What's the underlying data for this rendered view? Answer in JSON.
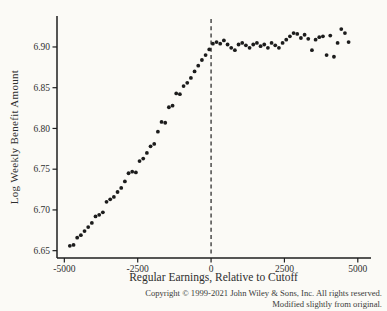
{
  "chart_data": {
    "type": "scatter",
    "title": "",
    "xlabel": "Regular Earnings, Relative to Cutoff",
    "ylabel": "Log Weekly Benefit Amount",
    "xlim": [
      -5250,
      5450
    ],
    "ylim": [
      6.641,
      6.938
    ],
    "x_ticks": [
      -5000,
      -2500,
      0,
      2500,
      5000
    ],
    "y_ticks": [
      6.65,
      6.7,
      6.75,
      6.8,
      6.85,
      6.9
    ],
    "grid": false,
    "legend": "none",
    "cutoff_line": {
      "x": 0,
      "style": "dashed",
      "color": "#1e1e1e"
    },
    "marker_color": "#1c1c1c",
    "axis_color": "#1e1e1e",
    "series": [
      {
        "name": "binned-means",
        "points": [
          [
            -4812,
            6.656
          ],
          [
            -4687,
            6.657
          ],
          [
            -4562,
            6.666
          ],
          [
            -4437,
            6.669
          ],
          [
            -4312,
            6.674
          ],
          [
            -4187,
            6.679
          ],
          [
            -4062,
            6.684
          ],
          [
            -3937,
            6.692
          ],
          [
            -3812,
            6.694
          ],
          [
            -3687,
            6.697
          ],
          [
            -3562,
            6.71
          ],
          [
            -3437,
            6.713
          ],
          [
            -3312,
            6.716
          ],
          [
            -3187,
            6.722
          ],
          [
            -3062,
            6.727
          ],
          [
            -2937,
            6.735
          ],
          [
            -2812,
            6.745
          ],
          [
            -2687,
            6.747
          ],
          [
            -2562,
            6.746
          ],
          [
            -2437,
            6.76
          ],
          [
            -2312,
            6.763
          ],
          [
            -2187,
            6.77
          ],
          [
            -2062,
            6.778
          ],
          [
            -1937,
            6.781
          ],
          [
            -1812,
            6.796
          ],
          [
            -1687,
            6.808
          ],
          [
            -1562,
            6.807
          ],
          [
            -1437,
            6.826
          ],
          [
            -1312,
            6.828
          ],
          [
            -1187,
            6.843
          ],
          [
            -1062,
            6.842
          ],
          [
            -937,
            6.852
          ],
          [
            -812,
            6.856
          ],
          [
            -687,
            6.862
          ],
          [
            -562,
            6.87
          ],
          [
            -437,
            6.877
          ],
          [
            -312,
            6.884
          ],
          [
            -187,
            6.89
          ],
          [
            -62,
            6.897
          ],
          [
            62,
            6.904
          ],
          [
            187,
            6.906
          ],
          [
            312,
            6.904
          ],
          [
            437,
            6.908
          ],
          [
            562,
            6.903
          ],
          [
            687,
            6.899
          ],
          [
            812,
            6.896
          ],
          [
            937,
            6.903
          ],
          [
            1062,
            6.905
          ],
          [
            1187,
            6.902
          ],
          [
            1312,
            6.899
          ],
          [
            1437,
            6.903
          ],
          [
            1562,
            6.905
          ],
          [
            1687,
            6.901
          ],
          [
            1812,
            6.903
          ],
          [
            1937,
            6.899
          ],
          [
            2062,
            6.905
          ],
          [
            2187,
            6.902
          ],
          [
            2312,
            6.899
          ],
          [
            2437,
            6.905
          ],
          [
            2562,
            6.909
          ],
          [
            2687,
            6.913
          ],
          [
            2812,
            6.917
          ],
          [
            2937,
            6.916
          ],
          [
            3062,
            6.911
          ],
          [
            3187,
            6.915
          ],
          [
            3312,
            6.91
          ],
          [
            3437,
            6.896
          ],
          [
            3562,
            6.909
          ],
          [
            3687,
            6.912
          ],
          [
            3812,
            6.913
          ],
          [
            3937,
            6.89
          ],
          [
            4062,
            6.914
          ],
          [
            4187,
            6.888
          ],
          [
            4312,
            6.905
          ],
          [
            4437,
            6.922
          ],
          [
            4562,
            6.917
          ],
          [
            4687,
            6.906
          ]
        ]
      }
    ]
  },
  "footer": {
    "copyright_line1": "Copyright © 1999-2021 John Wiley & Sons, Inc. All rights reserved.",
    "copyright_line2": "Modified slightly from original."
  }
}
